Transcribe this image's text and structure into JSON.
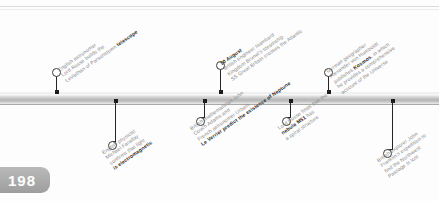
{
  "page": {
    "number": "198"
  },
  "timeline": {
    "bar_color": "#c9c9c9",
    "marker_color": "#1a1a1a",
    "text_color": "#8a8a8a",
    "highlight_color": "#2b2b2b"
  },
  "events": [
    {
      "id": "leviathan-telescope",
      "position": "above",
      "lines": [
        "English astronomer",
        "Lord Rosse builds the",
        "Leviathan of Parsonstown"
      ],
      "highlight": "telescope",
      "date": ""
    },
    {
      "id": "faraday-light-electromagnetic",
      "position": "below",
      "lines": [
        "English physicist",
        "Michael Faraday",
        "confirms that light"
      ],
      "highlight": "is electromagnetic",
      "date": ""
    },
    {
      "id": "ss-great-britain-atlantic",
      "position": "above",
      "date": "10 August",
      "lines": [
        "British engineer Isambard",
        "Kingdom Brunel's steamship",
        "SS Great Britain crosses the Atlantic"
      ],
      "highlight": ""
    },
    {
      "id": "neptune-prediction",
      "position": "below",
      "lines": [
        "British mathematician John",
        "Couch Adams and",
        "French astronomer Urbain"
      ],
      "highlight": "Le Verrier predict the existence of Neptune",
      "date": ""
    },
    {
      "id": "nebula-m51-spiral",
      "position": "below",
      "lines": [
        "Lord Rosse finds that the",
        "nebula M51 has",
        "a spiral structure"
      ],
      "highlight": "nebula M51",
      "date": ""
    },
    {
      "id": "humboldt-kosmos",
      "position": "above",
      "lines": [
        "German geographer",
        "Alexander von Humboldt",
        "publishes Kosmos, in which",
        "he provides a comprehensive",
        "account of the Universe"
      ],
      "highlight": "Kosmos",
      "date": ""
    },
    {
      "id": "franklin-expedition-lost",
      "position": "below",
      "lines": [
        "British explorer John",
        "Franklin's expedition to",
        "find the Northwest",
        "Passage is lost"
      ],
      "highlight": "",
      "date": ""
    }
  ]
}
